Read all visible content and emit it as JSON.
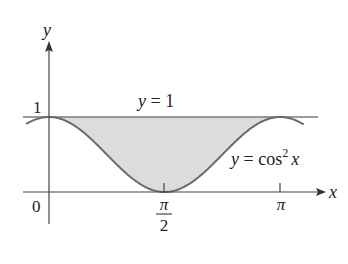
{
  "figure": {
    "type": "area-between-curves",
    "axes": {
      "x_label": "x",
      "y_label": "y",
      "origin_label": "0",
      "y_tick_label": "1",
      "x_ticks": [
        {
          "value": 1.5708,
          "label_num": "π",
          "label_den": "2"
        },
        {
          "value": 3.1416,
          "label": "π"
        }
      ]
    },
    "curves": [
      {
        "name": "upper",
        "equation_label": "y = 1",
        "expr": "1"
      },
      {
        "name": "lower",
        "equation_label_prefix": "y = cos",
        "equation_label_exp": "2",
        "equation_label_var": "x",
        "expr": "cos(x)^2"
      }
    ],
    "shaded_region": {
      "from_x": 0,
      "to_x": 3.1416,
      "between": [
        "cos(x)^2",
        "1"
      ]
    },
    "colors": {
      "fill": "#dcdcdc",
      "curve": "#6a6a6a",
      "line": "#7a7a7a",
      "axis": "#444444",
      "text": "#222222"
    }
  }
}
